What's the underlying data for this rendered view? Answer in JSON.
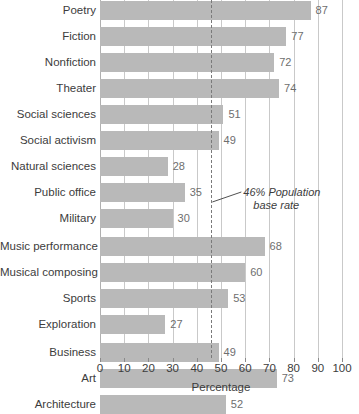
{
  "chart_data": {
    "type": "bar",
    "orientation": "horizontal",
    "title": "",
    "xlabel": "Percentage",
    "ylabel": "",
    "xlim": [
      0,
      100
    ],
    "xticks": [
      0,
      10,
      20,
      30,
      40,
      50,
      60,
      70,
      80,
      90,
      100
    ],
    "grid": "vertical",
    "legend": "none",
    "categories": [
      "Poetry",
      "Fiction",
      "Nonfiction",
      "Theater",
      "Social sciences",
      "Social activism",
      "Natural sciences",
      "Public office",
      "Military",
      "Music performance",
      "Musical composing",
      "Sports",
      "Exploration",
      "Business",
      "Art",
      "Architecture"
    ],
    "values": [
      87,
      77,
      72,
      74,
      51,
      49,
      28,
      35,
      30,
      68,
      60,
      53,
      27,
      49,
      73,
      52
    ],
    "group_breaks_after": [
      "Military",
      "Exploration"
    ],
    "annotations": [
      {
        "name": "population-base-rate",
        "value": 46,
        "line_1": "46% Population",
        "line_2": "base rate",
        "style": "dashed-vertical-line"
      }
    ],
    "colors": {
      "bar": "#b9b9b9",
      "gridline": "#c9c9c9",
      "value_label": "#6e6e6e",
      "text": "#3c3c3c",
      "reference_line": "#7a7a7a",
      "background": "#ffffff"
    }
  }
}
